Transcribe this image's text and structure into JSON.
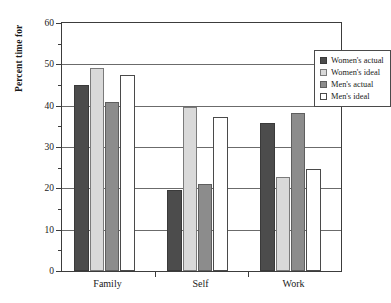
{
  "chart_data": {
    "type": "bar",
    "title": "",
    "subtitle": "",
    "xlabel": "",
    "ylabel": "Percent time for",
    "categories": [
      "Family",
      "Self",
      "Work"
    ],
    "series": [
      {
        "name": "Women's actual",
        "color": "#4c4c4c",
        "values": [
          45,
          19.5,
          35.7
        ]
      },
      {
        "name": "Women's ideal",
        "color": "#d9d9d9",
        "values": [
          49,
          39.7,
          22.7
        ]
      },
      {
        "name": "Men's actual",
        "color": "#8c8c8c",
        "values": [
          41,
          21,
          38.3
        ]
      },
      {
        "name": "Men's ideal",
        "color": "#ffffff",
        "values": [
          47.5,
          37.3,
          24.7
        ]
      }
    ],
    "ylim": [
      0,
      60
    ],
    "ytick_labels": [
      "0",
      "10",
      "20",
      "30",
      "40",
      "50",
      "60"
    ],
    "ytick_values": [
      0,
      10,
      20,
      30,
      40,
      50,
      60
    ],
    "yminor_values": [
      5,
      15,
      25,
      35,
      45,
      55
    ],
    "grid": "horizontal-major",
    "legend_position": "top-right-inside",
    "legend_entries": [
      "Women's actual",
      "Women's ideal",
      "Men's actual",
      "Men's ideal"
    ]
  }
}
